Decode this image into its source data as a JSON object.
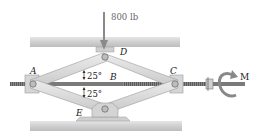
{
  "diagram": {
    "load": {
      "label": "800 lb",
      "direction": "down",
      "applied_at": "D"
    },
    "points": [
      {
        "id": "A",
        "label": "A"
      },
      {
        "id": "B",
        "label": "B"
      },
      {
        "id": "C",
        "label": "C"
      },
      {
        "id": "D",
        "label": "D"
      },
      {
        "id": "E",
        "label": "E"
      }
    ],
    "angles": [
      {
        "label": "25°",
        "position": "upper, between AD and AB"
      },
      {
        "label": "25°",
        "position": "lower, between AE and AB"
      }
    ],
    "moment": {
      "label": "M"
    },
    "colors": {
      "plate": "#d3d3d3",
      "link": "#d8d8d8",
      "link_edge": "#9a9a9a",
      "screw": "#6f6f6f",
      "arrow": "#8a8a8a"
    }
  }
}
